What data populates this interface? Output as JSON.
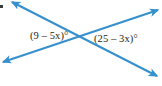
{
  "figure": {
    "type": "intersecting-lines-angle-diagram",
    "background_color": "#ffffff",
    "line_color": "#3690ce",
    "label_color": "#231f20",
    "labels": {
      "left_angle": "(9 – 5x)°",
      "right_angle": "(25 – 3x)°"
    },
    "geometry": {
      "intersection": {
        "x": 80,
        "y": 40
      },
      "lines": [
        {
          "name": "line-descending",
          "from": {
            "x": 12,
            "y": 2
          },
          "to": {
            "x": 157,
            "y": 76
          },
          "arrow_start": true,
          "arrow_end": true
        },
        {
          "name": "line-ascending",
          "from": {
            "x": 3,
            "y": 62
          },
          "to": {
            "x": 158,
            "y": 10
          },
          "arrow_start": true,
          "arrow_end": true
        }
      ]
    }
  }
}
